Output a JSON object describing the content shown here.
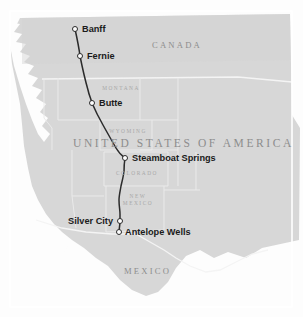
{
  "map": {
    "type": "route-map",
    "background_color": "#fdfdfd",
    "land_color": "#d7d7d7",
    "land_shadow_color": "#cccccc",
    "border_color": "#ffffff",
    "route_color": "#2b2b2b",
    "marker_fill": "#ffffff",
    "marker_stroke": "#2b2b2b",
    "country_label_color": "#8d8d8d",
    "state_label_color": "#a8a8a8",
    "city_label_color": "#1b1b1b",
    "countries": [
      {
        "name": "CANADA",
        "x": 182,
        "y": 46
      },
      {
        "name": "UNITED STATES OF AMERICA",
        "x": 152,
        "y": 144
      },
      {
        "name": "MEXICO",
        "x": 152,
        "y": 272
      }
    ],
    "states": [
      {
        "name": "MONTANA",
        "x": 120,
        "y": 88
      },
      {
        "name": "WYOMING",
        "x": 128,
        "y": 131
      },
      {
        "name": "COLORADO",
        "x": 136,
        "y": 173
      },
      {
        "name": "NEW MEXICO",
        "x": 137,
        "y": 199
      }
    ],
    "cities": [
      {
        "name": "Banff",
        "x": 75,
        "y": 29,
        "side": "right"
      },
      {
        "name": "Fernie",
        "x": 80,
        "y": 56,
        "side": "right"
      },
      {
        "name": "Butte",
        "x": 92,
        "y": 103,
        "side": "right"
      },
      {
        "name": "Steamboat Springs",
        "x": 125,
        "y": 158,
        "side": "right"
      },
      {
        "name": "Silver City",
        "x": 120,
        "y": 221,
        "side": "left"
      },
      {
        "name": "Antelope Wells",
        "x": 119,
        "y": 232,
        "side": "right"
      }
    ],
    "route": {
      "label": "route-line",
      "points": "75,29 80,56 84,72 88,90 92,103 99,118 108,134 116,148 125,158 124,172 121,186 119,200 120,214 120,221 119,232"
    }
  }
}
